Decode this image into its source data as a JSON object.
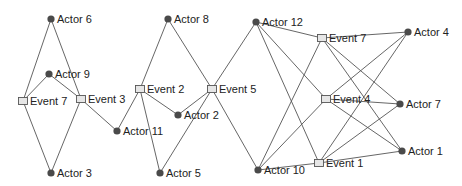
{
  "diagram": {
    "type": "bipartite-network",
    "colors": {
      "edge": "#555555",
      "actor_fill": "#4a4a4a",
      "event_fill": "#e6e6e6",
      "event_stroke": "#555555",
      "label": "#222222",
      "background": "#ffffff"
    },
    "nodes": [
      {
        "id": "actor6",
        "kind": "actor",
        "label": "Actor 6",
        "x": 51,
        "y": 19
      },
      {
        "id": "actor9",
        "kind": "actor",
        "label": "Actor 9",
        "x": 49,
        "y": 74
      },
      {
        "id": "event7a",
        "kind": "event",
        "label": "Event 7",
        "x": 23,
        "y": 101
      },
      {
        "id": "event3",
        "kind": "event",
        "label": "Event 3",
        "x": 81,
        "y": 99
      },
      {
        "id": "actor3",
        "kind": "actor",
        "label": "Actor 3",
        "x": 51,
        "y": 173
      },
      {
        "id": "actor11",
        "kind": "actor",
        "label": "Actor 11",
        "x": 117,
        "y": 131
      },
      {
        "id": "actor8",
        "kind": "actor",
        "label": "Actor 8",
        "x": 168,
        "y": 19
      },
      {
        "id": "event2",
        "kind": "event",
        "label": "Event 2",
        "x": 140,
        "y": 89
      },
      {
        "id": "event5",
        "kind": "event",
        "label": "Event 5",
        "x": 212,
        "y": 89
      },
      {
        "id": "actor2",
        "kind": "actor",
        "label": "Actor 2",
        "x": 178,
        "y": 115
      },
      {
        "id": "actor5",
        "kind": "actor",
        "label": "Actor 5",
        "x": 160,
        "y": 173
      },
      {
        "id": "actor12",
        "kind": "actor",
        "label": "Actor 12",
        "x": 256,
        "y": 22
      },
      {
        "id": "event7b",
        "kind": "event",
        "label": "Event 7",
        "x": 322,
        "y": 38
      },
      {
        "id": "actor4",
        "kind": "actor",
        "label": "Actor 4",
        "x": 408,
        "y": 32
      },
      {
        "id": "event4",
        "kind": "event",
        "label": "Event 4",
        "x": 326,
        "y": 99
      },
      {
        "id": "actor7",
        "kind": "actor",
        "label": "Actor 7",
        "x": 400,
        "y": 104
      },
      {
        "id": "event1",
        "kind": "event",
        "label": "Event 1",
        "x": 319,
        "y": 163
      },
      {
        "id": "actor1",
        "kind": "actor",
        "label": "Actor 1",
        "x": 402,
        "y": 151
      },
      {
        "id": "actor10",
        "kind": "actor",
        "label": "Actor 10",
        "x": 258,
        "y": 170
      }
    ],
    "edges": [
      [
        "actor6",
        "event7a"
      ],
      [
        "actor6",
        "event3"
      ],
      [
        "actor9",
        "event7a"
      ],
      [
        "actor9",
        "event3"
      ],
      [
        "event7a",
        "actor3"
      ],
      [
        "event3",
        "actor3"
      ],
      [
        "event3",
        "actor11"
      ],
      [
        "actor11",
        "event2"
      ],
      [
        "event2",
        "actor8"
      ],
      [
        "event2",
        "actor2"
      ],
      [
        "event2",
        "actor5"
      ],
      [
        "actor8",
        "event5"
      ],
      [
        "event5",
        "actor2"
      ],
      [
        "event5",
        "actor5"
      ],
      [
        "event5",
        "actor12"
      ],
      [
        "event5",
        "actor10"
      ],
      [
        "actor12",
        "event7b"
      ],
      [
        "actor12",
        "event4"
      ],
      [
        "actor12",
        "event1"
      ],
      [
        "actor10",
        "event7b"
      ],
      [
        "actor10",
        "event4"
      ],
      [
        "actor10",
        "event1"
      ],
      [
        "event7b",
        "actor4"
      ],
      [
        "event7b",
        "actor7"
      ],
      [
        "event7b",
        "actor1"
      ],
      [
        "event4",
        "actor4"
      ],
      [
        "event4",
        "actor7"
      ],
      [
        "event4",
        "actor1"
      ],
      [
        "event1",
        "actor4"
      ],
      [
        "event1",
        "actor7"
      ],
      [
        "event1",
        "actor1"
      ]
    ]
  }
}
